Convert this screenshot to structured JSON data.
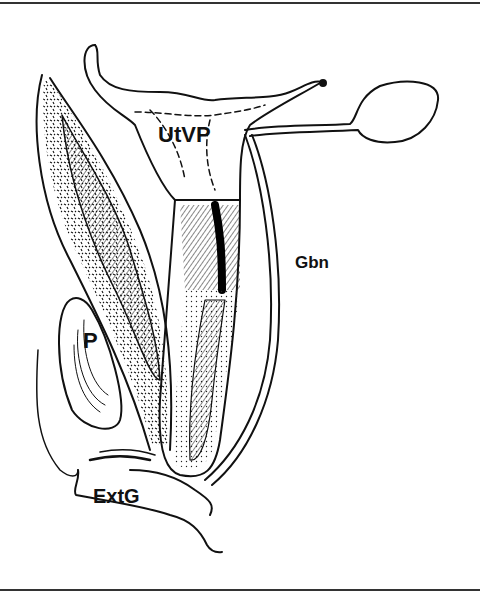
{
  "figure": {
    "labels": {
      "utvp": "UtVP",
      "gbn": "Gbn",
      "p": "P",
      "extg": "ExtG"
    },
    "colors": {
      "ink": "#111111",
      "paper": "#ffffff",
      "rule": "#333333"
    }
  }
}
